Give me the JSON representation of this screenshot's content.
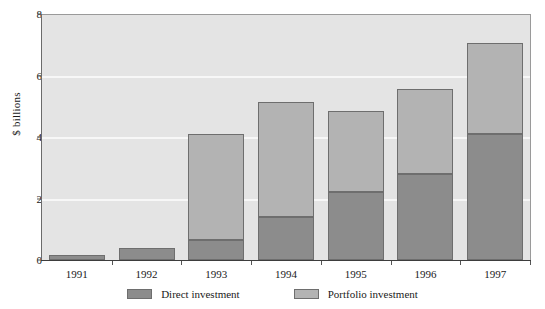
{
  "chart_data": {
    "type": "bar",
    "subtype": "stacked-bar",
    "title": "",
    "xlabel": "",
    "ylabel": "$ billions",
    "categories": [
      "1991",
      "1992",
      "1993",
      "1994",
      "1995",
      "1996",
      "1997"
    ],
    "series": [
      {
        "name": "Direct investment",
        "color": "#8c8c8c",
        "values": [
          0.15,
          0.4,
          0.65,
          1.4,
          2.2,
          2.8,
          4.1
        ]
      },
      {
        "name": "Portfolio investment",
        "color": "#b3b3b3",
        "values": [
          0.0,
          0.0,
          3.45,
          3.75,
          2.65,
          2.75,
          2.95
        ]
      }
    ],
    "totals": [
      0.15,
      0.4,
      4.1,
      5.15,
      4.85,
      5.55,
      7.05
    ],
    "ylim": [
      0,
      8
    ],
    "yticks": [
      0,
      2,
      4,
      6,
      8
    ],
    "ytick_labels": [
      "0",
      "2",
      "4",
      "6",
      "8"
    ],
    "grid": true,
    "grid_color": "#f7f7f7",
    "plot_background": "#e4e4e4",
    "legend_position": "bottom"
  },
  "legend": {
    "entries": [
      {
        "label": "Direct investment",
        "color": "#8c8c8c"
      },
      {
        "label": "Portfolio investment",
        "color": "#b3b3b3"
      }
    ]
  }
}
